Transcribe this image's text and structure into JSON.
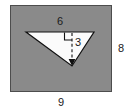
{
  "figure": {
    "background_color": "#ffffff",
    "rectangle": {
      "name": "outer-rectangle",
      "fill_color": "#8a8a8a",
      "stroke_color": "#4d4d4d",
      "width_label": "9",
      "height_label": "8"
    },
    "triangle": {
      "name": "inverted-triangle",
      "fill_color": "#fbfbfb",
      "stroke_color": "#111111",
      "base_label": "6",
      "height_label": "3",
      "orientation": "inverted"
    },
    "altitude": {
      "name": "altitude-dashed-line",
      "style": "dashed",
      "color": "#111111",
      "arrow": "down",
      "right_angle_marker": true
    },
    "labels": {
      "base": "6",
      "altitude": "3",
      "rect_height": "8",
      "rect_width": "9"
    }
  }
}
